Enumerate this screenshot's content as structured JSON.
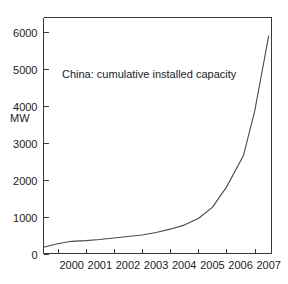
{
  "chart_data": {
    "type": "line",
    "title": "China: cumulative installed capacity",
    "xlabel": "",
    "ylabel": "MW",
    "xlim": [
      1999.5,
      2007.6
    ],
    "ylim": [
      0,
      6400
    ],
    "yticks": [
      0,
      1000,
      2000,
      3000,
      4000,
      5000,
      6000
    ],
    "ytick_labels": [
      "0",
      "1000",
      "2000",
      "3000",
      "4000",
      "5000",
      "6000"
    ],
    "xticks": [
      2000,
      2001,
      2002,
      2003,
      2004,
      2005,
      2006,
      2007
    ],
    "xtick_labels": [
      "2000",
      "2001",
      "2002",
      "2003",
      "2004",
      "2005",
      "2006",
      "2007"
    ],
    "grid": false,
    "legend": false,
    "line_color": "#4a4a4a",
    "axis_color": "#3a3a3a",
    "background": "#ffffff",
    "series": [
      {
        "name": "China cumulative installed capacity",
        "x": [
          1999.5,
          2000.0,
          2000.5,
          2001.0,
          2001.5,
          2002.0,
          2002.5,
          2003.0,
          2003.5,
          2004.0,
          2004.5,
          2005.0,
          2005.5,
          2006.0,
          2006.6,
          2007.0,
          2007.5
        ],
        "values": [
          170,
          265,
          330,
          350,
          380,
          420,
          460,
          500,
          570,
          660,
          770,
          950,
          1250,
          1800,
          2650,
          3850,
          5900
        ]
      }
    ]
  },
  "figure": {
    "title_position": {
      "x": 62,
      "y": 78
    },
    "ylabel_position": {
      "x": 10,
      "y": 122
    }
  }
}
